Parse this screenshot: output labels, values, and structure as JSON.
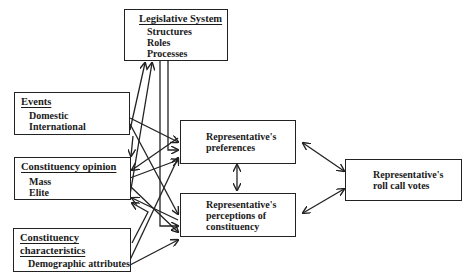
{
  "diagram": {
    "nodes": {
      "legislative": {
        "title": "Legislative System",
        "items": [
          "Structures",
          "Roles",
          "Processes"
        ]
      },
      "events": {
        "title": "Events",
        "items": [
          "Domestic",
          "International"
        ]
      },
      "opinion": {
        "title": "Constituency opinion",
        "items": [
          "Mass",
          "Elite"
        ]
      },
      "characteristics": {
        "title_line1": "Constituency",
        "title_line2": "characteristics",
        "items": [
          "Demographic attributes"
        ]
      },
      "preferences": {
        "line1": "Representative's",
        "line2": "preferences"
      },
      "perceptions": {
        "line1": "Representative's",
        "line2": "perceptions of",
        "line3": "constituency"
      },
      "votes": {
        "line1": "Representative's",
        "line2": "roll call votes"
      }
    },
    "edges": [
      {
        "from": "legislative",
        "to": "preferences"
      },
      {
        "from": "legislative",
        "to": "perceptions"
      },
      {
        "from": "events",
        "to": "legislative"
      },
      {
        "from": "events",
        "to": "preferences"
      },
      {
        "from": "events",
        "to": "perceptions"
      },
      {
        "from": "events",
        "to": "opinion"
      },
      {
        "from": "opinion",
        "to": "legislative"
      },
      {
        "from": "opinion",
        "to": "preferences"
      },
      {
        "from": "opinion",
        "to": "perceptions"
      },
      {
        "from": "characteristics",
        "to": "opinion"
      },
      {
        "from": "characteristics",
        "to": "preferences"
      },
      {
        "from": "characteristics",
        "to": "perceptions"
      },
      {
        "from": "preferences",
        "to": "perceptions",
        "bidirectional": true
      },
      {
        "from": "preferences",
        "to": "votes",
        "bidirectional": true
      },
      {
        "from": "perceptions",
        "to": "votes",
        "bidirectional": true
      }
    ]
  }
}
